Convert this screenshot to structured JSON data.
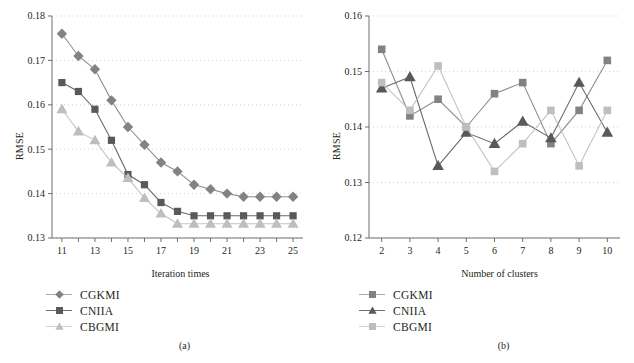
{
  "figure": {
    "panels": [
      {
        "caption": "(a)",
        "xlabel": "Iteration times",
        "ylabel": "RMSE",
        "legend": [
          {
            "label": "CGKMI",
            "marker": "diamond",
            "color": "#808285"
          },
          {
            "label": "CNIIA",
            "marker": "square",
            "color": "#58595b"
          },
          {
            "label": "CBGMI",
            "marker": "triangle",
            "color": "#bcbec0"
          }
        ]
      },
      {
        "caption": "(b)",
        "xlabel": "Number of clusters",
        "ylabel": "RMSE",
        "legend": [
          {
            "label": "CGKMI",
            "marker": "square",
            "color": "#808285"
          },
          {
            "label": "CNIIA",
            "marker": "triangle",
            "color": "#58595b"
          },
          {
            "label": "CBGMI",
            "marker": "square",
            "color": "#bcbec0"
          }
        ]
      }
    ]
  },
  "chart_data": [
    {
      "type": "line",
      "title": "",
      "subplot": "(a)",
      "xlabel": "Iteration times",
      "ylabel": "RMSE",
      "x": [
        11,
        12,
        13,
        14,
        15,
        16,
        17,
        18,
        19,
        20,
        21,
        22,
        23,
        24,
        25
      ],
      "xlim": [
        10.4,
        25.6
      ],
      "ylim": [
        0.13,
        0.18
      ],
      "xticks": [
        11,
        12,
        13,
        14,
        15,
        16,
        17,
        18,
        19,
        20,
        21,
        22,
        23,
        24,
        25
      ],
      "xticklabels": [
        "11",
        "",
        "13",
        "",
        "15",
        "",
        "17",
        "",
        "19",
        "",
        "21",
        "",
        "23",
        "",
        "25"
      ],
      "yticks": [
        0.13,
        0.14,
        0.15,
        0.16,
        0.17,
        0.18
      ],
      "yticklabels": [
        "0.13",
        "0.14",
        "0.15",
        "0.16",
        "0.17",
        "0.18"
      ],
      "grid": "horizontal-dotted",
      "legend_position": "below-left",
      "series": [
        {
          "name": "CGKMI",
          "marker": "diamond",
          "color": "#808285",
          "values": [
            0.176,
            0.171,
            0.168,
            0.161,
            0.155,
            0.151,
            0.147,
            0.145,
            0.142,
            0.141,
            0.14,
            0.1393,
            0.1393,
            0.1393,
            0.1393
          ]
        },
        {
          "name": "CNIIA",
          "marker": "square",
          "color": "#58595b",
          "values": [
            0.165,
            0.163,
            0.159,
            0.152,
            0.1443,
            0.142,
            0.138,
            0.136,
            0.135,
            0.135,
            0.135,
            0.135,
            0.135,
            0.135,
            0.135
          ]
        },
        {
          "name": "CBGMI",
          "marker": "triangle",
          "color": "#bcbec0",
          "values": [
            0.159,
            0.154,
            0.152,
            0.147,
            0.1435,
            0.139,
            0.1355,
            0.1332,
            0.1332,
            0.1332,
            0.1332,
            0.1332,
            0.1332,
            0.1332,
            0.1332
          ]
        }
      ]
    },
    {
      "type": "line",
      "title": "",
      "subplot": "(b)",
      "xlabel": "Number of clusters",
      "ylabel": "RMSE",
      "x": [
        2,
        3,
        4,
        5,
        6,
        7,
        8,
        9,
        10
      ],
      "xlim": [
        1.55,
        10.45
      ],
      "ylim": [
        0.12,
        0.16
      ],
      "xticks": [
        2,
        3,
        4,
        5,
        6,
        7,
        8,
        9,
        10
      ],
      "xticklabels": [
        "2",
        "3",
        "4",
        "5",
        "6",
        "7",
        "8",
        "9",
        "10"
      ],
      "yticks": [
        0.12,
        0.13,
        0.14,
        0.15,
        0.16
      ],
      "yticklabels": [
        "0.12",
        "0.13",
        "0.14",
        "0.15",
        "0.16"
      ],
      "grid": "horizontal-dotted",
      "legend_position": "below-left",
      "series": [
        {
          "name": "CGKMI",
          "marker": "square",
          "color": "#808285",
          "values": [
            0.154,
            0.142,
            0.145,
            0.14,
            0.146,
            0.148,
            0.137,
            0.143,
            0.152
          ]
        },
        {
          "name": "CNIIA",
          "marker": "triangle",
          "color": "#58595b",
          "values": [
            0.147,
            0.149,
            0.133,
            0.139,
            0.137,
            0.141,
            0.138,
            0.148,
            0.139
          ]
        },
        {
          "name": "CBGMI",
          "marker": "square",
          "color": "#bcbec0",
          "values": [
            0.148,
            0.143,
            0.151,
            0.14,
            0.132,
            0.137,
            0.143,
            0.133,
            0.143
          ]
        }
      ]
    }
  ]
}
